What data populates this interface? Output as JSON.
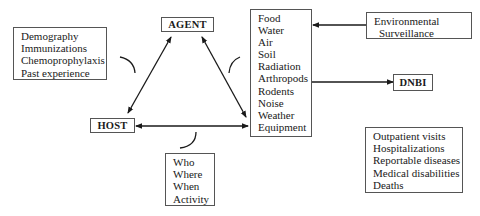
{
  "diagram": {
    "type": "epidemiological-triad",
    "nodes": {
      "agent": {
        "label": "AGENT"
      },
      "host": {
        "label": "HOST"
      },
      "dnbi": {
        "label": "DNBI"
      }
    },
    "host_factors": {
      "items": [
        "Demography",
        "Immunizations",
        "Chemoprophylaxis",
        "Past experience"
      ]
    },
    "environment_factors": {
      "items": [
        "Food",
        "Water",
        "Air",
        "Soil",
        "Radiation",
        "Arthropods",
        "Rodents",
        "Noise",
        "Weather",
        "Equipment"
      ]
    },
    "surveillance": {
      "line1": "Environmental",
      "line2": "Surveillance"
    },
    "interaction_factors": {
      "items": [
        "Who",
        "Where",
        "When",
        "Activity"
      ]
    },
    "outcomes": {
      "items": [
        "Outpatient visits",
        "Hospitalizations",
        "Reportable diseases",
        "Medical disabilities",
        "Deaths"
      ]
    },
    "edges": [
      {
        "from": "agent",
        "to": "host",
        "direction": "both"
      },
      {
        "from": "agent",
        "to": "environment",
        "direction": "both"
      },
      {
        "from": "host",
        "to": "environment",
        "direction": "both"
      },
      {
        "from": "surveillance",
        "to": "environment",
        "direction": "forward"
      },
      {
        "from": "environment",
        "to": "dnbi",
        "direction": "forward"
      }
    ]
  }
}
